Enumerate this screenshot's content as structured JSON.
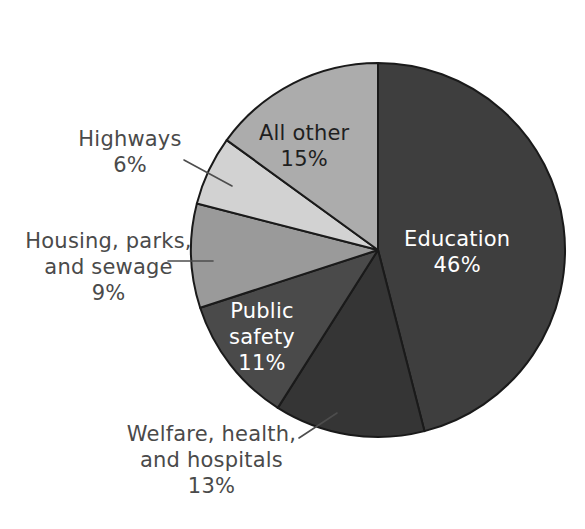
{
  "chart_data": {
    "type": "pie",
    "title": "",
    "subtitle": "",
    "xlabel": "",
    "ylabel": "",
    "legend_position": "none",
    "grid": false,
    "value_unit": "percent",
    "start_angle_deg": 0,
    "direction": "clockwise",
    "categories": [
      "Education",
      "Welfare, health, and hospitals",
      "Public safety",
      "Housing, parks, and sewage",
      "Highways",
      "All other"
    ],
    "values": [
      46,
      13,
      11,
      9,
      6,
      15
    ],
    "slices": [
      {
        "id": "education",
        "label": "Education",
        "value_text": "46%",
        "value": 46,
        "color": "#3e3e3e",
        "label_placement": "inside",
        "label_color": "#ffffff"
      },
      {
        "id": "welfare-health-hospitals",
        "label_line1": "Welfare, health,",
        "label_line2": "and hospitals",
        "label": "Welfare, health, and hospitals",
        "value_text": "13%",
        "value": 13,
        "color": "#353535",
        "label_placement": "outside",
        "label_color": "#4a4a4a"
      },
      {
        "id": "public-safety",
        "label_line1": "Public",
        "label_line2": "safety",
        "label": "Public safety",
        "value_text": "11%",
        "value": 11,
        "color": "#4a4a4a",
        "label_placement": "inside",
        "label_color": "#ffffff"
      },
      {
        "id": "housing-parks-sewage",
        "label_line1": "Housing, parks,",
        "label_line2": "and sewage",
        "label": "Housing, parks, and sewage",
        "value_text": "9%",
        "value": 9,
        "color": "#9a9a9a",
        "label_placement": "outside",
        "label_color": "#4a4a4a"
      },
      {
        "id": "highways",
        "label": "Highways",
        "value_text": "6%",
        "value": 6,
        "color": "#d2d2d2",
        "label_placement": "outside",
        "label_color": "#4a4a4a"
      },
      {
        "id": "all-other",
        "label": "All other",
        "value_text": "15%",
        "value": 15,
        "color": "#acacac",
        "label_placement": "inside",
        "label_color": "#1f1f1f"
      }
    ]
  },
  "geometry": {
    "center_x": 378,
    "center_y": 250,
    "radius": 187
  },
  "colors": {
    "background": "#ffffff",
    "slice_outline": "#1a1a1a",
    "leader_line": "#4d4d4d",
    "outside_label_text": "#4a4a4a"
  }
}
